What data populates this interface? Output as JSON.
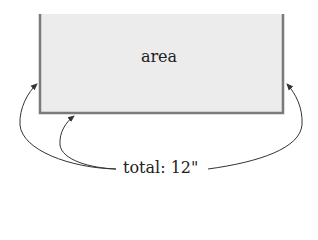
{
  "diagram": {
    "region_label": "area",
    "total_label": "total: 12\"",
    "colors": {
      "fill": "#ececec",
      "border": "#7a7a7a",
      "arrow": "#333333"
    },
    "arrows": [
      {
        "name": "left-side-arrow",
        "target": "left edge"
      },
      {
        "name": "bottom-side-arrow",
        "target": "bottom edge"
      },
      {
        "name": "right-side-arrow",
        "target": "right edge"
      }
    ]
  }
}
